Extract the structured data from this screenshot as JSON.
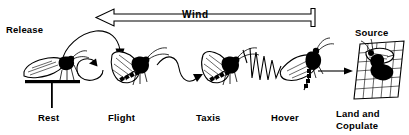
{
  "figure": {
    "title_text": "Wind",
    "background_color": "#ffffff",
    "ink_color": "#000000",
    "width": 409,
    "height": 135
  },
  "wind": {
    "label": "Wind",
    "direction": "left",
    "arrow_icon": "wind-arrow-left-icon"
  },
  "annotations": {
    "release": "Release",
    "source": "Source"
  },
  "stages": [
    {
      "key": "rest",
      "label": "Rest",
      "icon": "moth-resting-icon"
    },
    {
      "key": "flight",
      "label": "Flight",
      "icon": "moth-flying-icon"
    },
    {
      "key": "taxis",
      "label": "Taxis",
      "icon": "moth-taxis-icon"
    },
    {
      "key": "hover",
      "label": "Hover",
      "icon": "moth-hovering-icon"
    },
    {
      "key": "land",
      "label_line1": "Land and",
      "label_line2": "Copulate",
      "icon": "moths-on-source-icon"
    }
  ],
  "paths": {
    "release_arc": "arc-arrow-release-to-flight",
    "loop": "loop-arrow-icon",
    "wavy": "wavy-path-icon",
    "zigzag": "zigzag-path-icon",
    "straight": "straight-arrow-icon"
  }
}
